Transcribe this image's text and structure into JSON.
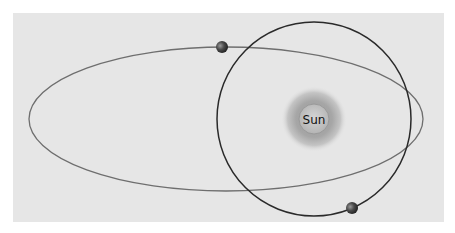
{
  "diagram": {
    "title": "",
    "sun": {
      "label": "Sun",
      "cx": 314,
      "cy": 119
    },
    "orbits": [
      {
        "name": "elliptical-orbit",
        "cx": 226,
        "cy": 119,
        "rx": 197,
        "ry": 72,
        "color": "#6e6e6e"
      },
      {
        "name": "circular-orbit",
        "cx": 314,
        "cy": 119,
        "r": 97,
        "color": "#2a2a2a"
      }
    ],
    "bodies": [
      {
        "name": "planet-on-ellipse",
        "cx": 222,
        "cy": 47,
        "r": 6
      },
      {
        "name": "planet-on-circle",
        "cx": 352,
        "cy": 208,
        "r": 6
      }
    ],
    "colors": {
      "background": "#e6e6e6",
      "sun_glow": "#a8a8a8",
      "sun_core": "#c8c8c8"
    }
  }
}
